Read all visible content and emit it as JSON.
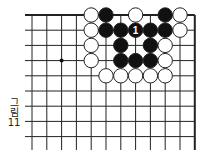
{
  "figure": {
    "caption_lines": [
      "그",
      "림",
      "11"
    ],
    "board": {
      "origin_x": 32,
      "origin_y": 15,
      "spacing_x": 14.8,
      "spacing_y": 15.2,
      "cols": 12,
      "rows": 9,
      "left_line_start": 25,
      "bottom_line_end": 150,
      "line_color": "#222222",
      "top_edge": true,
      "right_edge": true,
      "star_points": [
        {
          "col": 2,
          "row": 3
        }
      ],
      "stones": [
        {
          "col": 4,
          "row": 0,
          "color": "white"
        },
        {
          "col": 5,
          "row": 0,
          "color": "black"
        },
        {
          "col": 7,
          "row": 0,
          "color": "white"
        },
        {
          "col": 9,
          "row": 0,
          "color": "black"
        },
        {
          "col": 10,
          "row": 0,
          "color": "white"
        },
        {
          "col": 4,
          "row": 1,
          "color": "white"
        },
        {
          "col": 5,
          "row": 1,
          "color": "black"
        },
        {
          "col": 6,
          "row": 1,
          "color": "black"
        },
        {
          "col": 7,
          "row": 1,
          "color": "black",
          "label": "1"
        },
        {
          "col": 8,
          "row": 1,
          "color": "black"
        },
        {
          "col": 9,
          "row": 1,
          "color": "black"
        },
        {
          "col": 10,
          "row": 1,
          "color": "white"
        },
        {
          "col": 4,
          "row": 2,
          "color": "white"
        },
        {
          "col": 6,
          "row": 2,
          "color": "black"
        },
        {
          "col": 8,
          "row": 2,
          "color": "black"
        },
        {
          "col": 9,
          "row": 2,
          "color": "white"
        },
        {
          "col": 4,
          "row": 3,
          "color": "white"
        },
        {
          "col": 6,
          "row": 3,
          "color": "black"
        },
        {
          "col": 7,
          "row": 3,
          "color": "black"
        },
        {
          "col": 8,
          "row": 3,
          "color": "black"
        },
        {
          "col": 9,
          "row": 3,
          "color": "white"
        },
        {
          "col": 5,
          "row": 4,
          "color": "white"
        },
        {
          "col": 6,
          "row": 4,
          "color": "white"
        },
        {
          "col": 7,
          "row": 4,
          "color": "white"
        },
        {
          "col": 8,
          "row": 4,
          "color": "white"
        },
        {
          "col": 9,
          "row": 4,
          "color": "white"
        }
      ]
    }
  }
}
